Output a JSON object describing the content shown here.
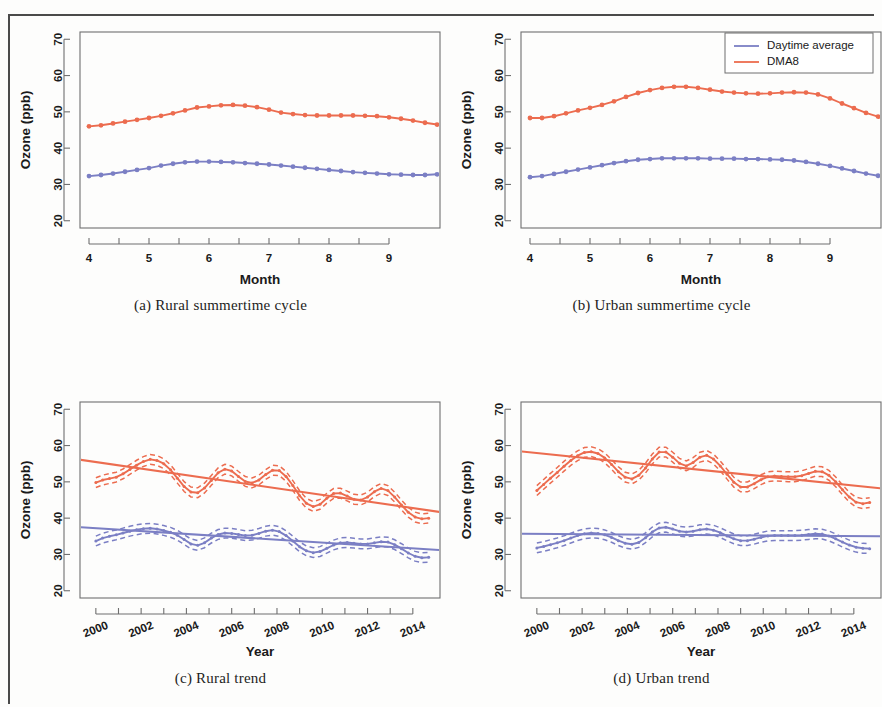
{
  "figure": {
    "panels": [
      {
        "key": "a",
        "caption": "(a) Rural summertime cycle"
      },
      {
        "key": "b",
        "caption": "(b) Urban summertime cycle"
      },
      {
        "key": "c",
        "caption": "(c) Rural trend"
      },
      {
        "key": "d",
        "caption": "(d) Urban trend"
      }
    ]
  },
  "legend": {
    "position": "top-right-panel-b",
    "entries": [
      {
        "label": "Daytime average",
        "color": "#7b7fc4"
      },
      {
        "label": "DMA8",
        "color": "#ec6c4f"
      }
    ]
  },
  "colors": {
    "daytime_average": "#7b7fc4",
    "dma8": "#ec6c4f",
    "axis": "#6f6f6f",
    "text": "#1a1a1a",
    "page_border": "#4a4a4a"
  },
  "chart_data": [
    {
      "id": "a",
      "type": "line",
      "title": "(a) Rural summertime cycle",
      "xlabel": "Month",
      "ylabel": "Ozone (ppb)",
      "xlim": [
        3.85,
        9.85
      ],
      "ylim": [
        18,
        72
      ],
      "xticks": [
        4,
        5,
        6,
        7,
        8,
        9
      ],
      "yticks": [
        20,
        30,
        40,
        50,
        60,
        70
      ],
      "grid": false,
      "markers": "filled-circle",
      "x": [
        4.0,
        4.2,
        4.4,
        4.6,
        4.8,
        5.0,
        5.2,
        5.4,
        5.6,
        5.8,
        6.0,
        6.2,
        6.4,
        6.6,
        6.8,
        7.0,
        7.2,
        7.4,
        7.6,
        7.8,
        8.0,
        8.2,
        8.4,
        8.6,
        8.8,
        9.0,
        9.2,
        9.4,
        9.6,
        9.8
      ],
      "series": [
        {
          "name": "DMA8",
          "color": "#ec6c4f",
          "values": [
            46.0,
            46.3,
            46.8,
            47.3,
            47.8,
            48.3,
            48.9,
            49.6,
            50.4,
            51.2,
            51.5,
            51.8,
            51.9,
            51.7,
            51.3,
            50.6,
            49.8,
            49.4,
            49.1,
            49.0,
            49.0,
            49.0,
            49.0,
            48.9,
            48.8,
            48.5,
            48.1,
            47.6,
            47.0,
            46.5
          ]
        },
        {
          "name": "Daytime average",
          "color": "#7b7fc4",
          "values": [
            32.3,
            32.6,
            33.0,
            33.5,
            34.0,
            34.5,
            35.2,
            35.7,
            36.1,
            36.3,
            36.3,
            36.2,
            36.1,
            35.9,
            35.7,
            35.5,
            35.2,
            34.9,
            34.6,
            34.3,
            34.0,
            33.7,
            33.4,
            33.2,
            33.0,
            32.8,
            32.7,
            32.6,
            32.6,
            32.8
          ]
        }
      ]
    },
    {
      "id": "b",
      "type": "line",
      "title": "(b) Urban summertime cycle",
      "xlabel": "Month",
      "ylabel": "Ozone (ppb)",
      "xlim": [
        3.85,
        9.85
      ],
      "ylim": [
        18,
        72
      ],
      "xticks": [
        4,
        5,
        6,
        7,
        8,
        9
      ],
      "yticks": [
        20,
        30,
        40,
        50,
        60,
        70
      ],
      "grid": false,
      "markers": "filled-circle",
      "x": [
        4.0,
        4.2,
        4.4,
        4.6,
        4.8,
        5.0,
        5.2,
        5.4,
        5.6,
        5.8,
        6.0,
        6.2,
        6.4,
        6.6,
        6.8,
        7.0,
        7.2,
        7.4,
        7.6,
        7.8,
        8.0,
        8.2,
        8.4,
        8.6,
        8.8,
        9.0,
        9.2,
        9.4,
        9.6,
        9.8
      ],
      "series": [
        {
          "name": "DMA8",
          "color": "#ec6c4f",
          "values": [
            48.3,
            48.3,
            48.8,
            49.6,
            50.4,
            51.1,
            51.9,
            52.9,
            54.1,
            55.2,
            56.0,
            56.6,
            56.9,
            56.9,
            56.6,
            56.1,
            55.6,
            55.3,
            55.1,
            55.0,
            55.1,
            55.3,
            55.4,
            55.3,
            54.8,
            53.7,
            52.3,
            51.0,
            49.7,
            48.7
          ]
        },
        {
          "name": "Daytime average",
          "color": "#7b7fc4",
          "values": [
            32.0,
            32.3,
            32.9,
            33.5,
            34.1,
            34.7,
            35.3,
            35.9,
            36.4,
            36.8,
            37.0,
            37.2,
            37.2,
            37.2,
            37.2,
            37.1,
            37.1,
            37.1,
            37.0,
            37.0,
            36.9,
            36.8,
            36.6,
            36.2,
            35.7,
            35.1,
            34.4,
            33.7,
            33.0,
            32.4
          ]
        }
      ]
    },
    {
      "id": "c",
      "type": "line",
      "title": "(c) Rural trend",
      "xlabel": "Year",
      "ylabel": "Ozone (ppb)",
      "xlim": [
        1999.3,
        2015.2
      ],
      "ylim": [
        18,
        72
      ],
      "xticks": [
        2000,
        2002,
        2004,
        2006,
        2008,
        2010,
        2012,
        2014
      ],
      "yticks": [
        20,
        30,
        40,
        50,
        60,
        70
      ],
      "grid": false,
      "xtick_rotation_deg": 45,
      "markers": "filled-circle",
      "x": [
        2000.0,
        2000.3,
        2000.6,
        2000.9,
        2001.2,
        2001.5,
        2001.8,
        2002.1,
        2002.4,
        2002.7,
        2003.0,
        2003.3,
        2003.6,
        2003.9,
        2004.2,
        2004.5,
        2004.8,
        2005.1,
        2005.4,
        2005.7,
        2006.0,
        2006.3,
        2006.6,
        2006.9,
        2007.2,
        2007.5,
        2007.8,
        2008.1,
        2008.4,
        2008.7,
        2009.0,
        2009.3,
        2009.6,
        2009.9,
        2010.2,
        2010.5,
        2010.8,
        2011.1,
        2011.4,
        2011.7,
        2012.0,
        2012.3,
        2012.6,
        2012.9,
        2013.2,
        2013.5,
        2013.8,
        2014.1,
        2014.4,
        2014.7
      ],
      "series": [
        {
          "name": "DMA8 smooth",
          "color": "#ec6c4f",
          "values": [
            49.8,
            50.5,
            50.9,
            51.3,
            52.2,
            53.4,
            54.6,
            55.6,
            56.2,
            55.9,
            55.0,
            53.3,
            51.0,
            48.7,
            47.2,
            47.0,
            48.3,
            50.4,
            52.5,
            53.5,
            53.0,
            51.5,
            50.1,
            49.7,
            50.5,
            52.0,
            53.2,
            53.1,
            51.5,
            49.0,
            46.2,
            44.1,
            43.2,
            43.8,
            45.5,
            46.8,
            46.9,
            46.1,
            45.2,
            45.0,
            45.8,
            47.3,
            48.2,
            47.6,
            45.8,
            43.6,
            41.6,
            40.3,
            39.8,
            40.0
          ]
        },
        {
          "name": "DMA8 linear trend",
          "color": "#ec6c4f",
          "kind": "linear",
          "endpoints": [
            {
              "x": 1999.3,
              "y": 56.1
            },
            {
              "x": 2015.2,
              "y": 41.7
            }
          ]
        },
        {
          "name": "Daytime average smooth",
          "color": "#7b7fc4",
          "values": [
            33.7,
            34.5,
            35.0,
            35.4,
            35.9,
            36.4,
            36.8,
            37.1,
            37.2,
            37.0,
            36.6,
            36.1,
            35.3,
            34.1,
            32.9,
            32.5,
            33.2,
            34.5,
            35.5,
            35.9,
            35.8,
            35.5,
            35.2,
            35.3,
            35.8,
            36.4,
            36.7,
            36.3,
            35.2,
            33.7,
            32.1,
            31.0,
            30.5,
            30.8,
            31.7,
            32.6,
            33.2,
            33.3,
            33.1,
            32.9,
            32.9,
            33.2,
            33.5,
            33.4,
            32.7,
            31.6,
            30.4,
            29.5,
            29.1,
            29.2
          ]
        },
        {
          "name": "Daytime average linear trend",
          "color": "#7b7fc4",
          "kind": "linear",
          "endpoints": [
            {
              "x": 1999.3,
              "y": 37.5
            },
            {
              "x": 2015.2,
              "y": 31.2
            }
          ]
        }
      ],
      "bands": "dashed 95% confidence interval, approx ±1.3 ppb"
    },
    {
      "id": "d",
      "type": "line",
      "title": "(d) Urban trend",
      "xlabel": "Year",
      "ylabel": "Ozone (ppb)",
      "xlim": [
        1999.3,
        2015.2
      ],
      "ylim": [
        18,
        72
      ],
      "xticks": [
        2000,
        2002,
        2004,
        2006,
        2008,
        2010,
        2012,
        2014
      ],
      "yticks": [
        20,
        30,
        40,
        50,
        60,
        70
      ],
      "grid": false,
      "xtick_rotation_deg": 45,
      "markers": "filled-circle",
      "x": [
        2000.0,
        2000.3,
        2000.6,
        2000.9,
        2001.2,
        2001.5,
        2001.8,
        2002.1,
        2002.4,
        2002.7,
        2003.0,
        2003.3,
        2003.6,
        2003.9,
        2004.2,
        2004.5,
        2004.8,
        2005.1,
        2005.4,
        2005.7,
        2006.0,
        2006.3,
        2006.6,
        2006.9,
        2007.2,
        2007.5,
        2007.8,
        2008.1,
        2008.4,
        2008.7,
        2009.0,
        2009.3,
        2009.6,
        2009.9,
        2010.2,
        2010.5,
        2010.8,
        2011.1,
        2011.4,
        2011.7,
        2012.0,
        2012.3,
        2012.6,
        2012.9,
        2013.2,
        2013.5,
        2013.8,
        2014.1,
        2014.4,
        2014.7
      ],
      "series": [
        {
          "name": "DMA8 smooth",
          "color": "#ec6c4f",
          "values": [
            47.6,
            49.3,
            51.0,
            52.6,
            54.3,
            55.9,
            57.2,
            58.1,
            58.3,
            57.8,
            56.6,
            54.8,
            52.8,
            51.3,
            50.8,
            51.8,
            53.8,
            56.3,
            58.2,
            58.2,
            56.8,
            55.1,
            54.4,
            55.3,
            56.8,
            57.3,
            56.3,
            54.4,
            52.1,
            49.9,
            48.6,
            48.6,
            49.5,
            50.6,
            51.4,
            51.6,
            51.5,
            51.4,
            51.4,
            51.7,
            52.3,
            52.9,
            52.8,
            51.8,
            50.0,
            47.8,
            45.8,
            44.4,
            44.0,
            44.3
          ]
        },
        {
          "name": "DMA8 linear trend",
          "color": "#ec6c4f",
          "kind": "linear",
          "endpoints": [
            {
              "x": 1999.3,
              "y": 58.4
            },
            {
              "x": 2015.2,
              "y": 48.2
            }
          ]
        },
        {
          "name": "Daytime average smooth",
          "color": "#7b7fc4",
          "values": [
            31.8,
            32.2,
            32.7,
            33.2,
            33.8,
            34.5,
            35.2,
            35.7,
            35.9,
            35.8,
            35.4,
            34.7,
            33.8,
            33.1,
            32.8,
            33.3,
            34.6,
            36.2,
            37.3,
            37.5,
            37.0,
            36.4,
            36.2,
            36.4,
            36.8,
            37.0,
            36.7,
            36.0,
            35.1,
            34.3,
            33.8,
            33.8,
            34.2,
            34.7,
            35.1,
            35.2,
            35.2,
            35.2,
            35.2,
            35.3,
            35.5,
            35.7,
            35.6,
            35.1,
            34.3,
            33.4,
            32.6,
            32.0,
            31.7,
            31.6
          ]
        },
        {
          "name": "Daytime average linear trend",
          "color": "#7b7fc4",
          "kind": "linear",
          "endpoints": [
            {
              "x": 1999.3,
              "y": 35.7
            },
            {
              "x": 2015.2,
              "y": 35.0
            }
          ]
        }
      ],
      "bands": "dashed 95% confidence interval, approx ±1.3 ppb"
    }
  ]
}
